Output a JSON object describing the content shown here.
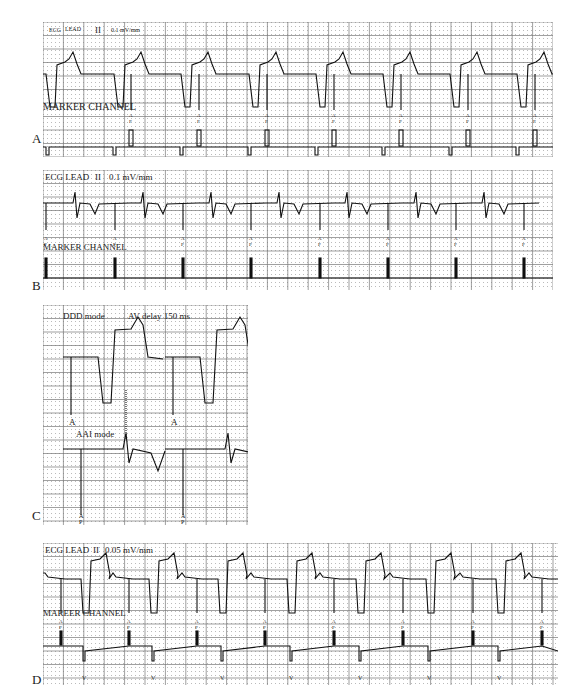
{
  "figure": {
    "panels": [
      {
        "id": "A",
        "letter": "A",
        "box": {
          "x": 43,
          "y": 22,
          "w": 510,
          "h": 135
        },
        "letter_pos": {
          "x": 32,
          "y": 143
        },
        "labels": {
          "lead": "ECG",
          "lead2": "LEAD",
          "lead_num": "II",
          "gain": "0.1 mV/mm",
          "marker": "MARKER CHANNEL"
        },
        "ecg_baseline": 60,
        "ecg_beats": [
          0,
          68,
          135,
          203,
          270,
          337,
          404,
          471
        ],
        "style": "paced_wide",
        "ap_markers": [
          88,
          156,
          224,
          291,
          358,
          425,
          492
        ],
        "vp_markers": [
          3,
          70,
          137,
          205,
          272,
          339,
          406,
          473
        ],
        "marker_glyph_ap": "A P",
        "marker_glyph_vp": "V"
      },
      {
        "id": "B",
        "letter": "B",
        "box": {
          "x": 43,
          "y": 170,
          "w": 510,
          "h": 120
        },
        "letter_pos": {
          "x": 32,
          "y": 290
        },
        "labels": {
          "lead": "ECG LEAD",
          "lead_num": "II",
          "gain": "0.1 mV/mm",
          "marker": "MARKER CHANNEL"
        },
        "style": "aai",
        "qrs_positions": [
          32,
          100,
          168,
          236,
          304,
          373,
          441
        ],
        "ap_markers": [
          3,
          72,
          140,
          208,
          277,
          345,
          413,
          481
        ],
        "marker_glyph_ap": "A P"
      },
      {
        "id": "C",
        "letter": "C",
        "box": {
          "x": 43,
          "y": 305,
          "w": 205,
          "h": 220
        },
        "letter_pos": {
          "x": 32,
          "y": 520
        },
        "labels": {
          "top_mode": "DDD mode",
          "av_delay": "AV delay 150 ms",
          "bottom_mode": "AAI mode",
          "marker_a": "A",
          "marker_ap": "A P"
        },
        "style": "ddd_vs_aai",
        "beats": [
          20,
          122
        ]
      },
      {
        "id": "D",
        "letter": "D",
        "box": {
          "x": 43,
          "y": 543,
          "w": 515,
          "h": 142
        },
        "letter_pos": {
          "x": 32,
          "y": 684
        },
        "labels": {
          "lead": "ECG LEAD",
          "lead_num": "II",
          "gain": "0.05 mV/mm",
          "marker": "MAREER CHANNEL"
        },
        "style": "paced_wide_d",
        "ecg_beats": [
          0,
          68,
          137,
          206,
          275,
          345,
          415,
          484
        ],
        "ap_markers": [
          18,
          86,
          154,
          222,
          291,
          360,
          430,
          499
        ],
        "vp_markers": [
          40,
          109,
          178,
          247,
          316,
          385,
          455
        ],
        "marker_glyph_ap": "A P",
        "marker_glyph_vp": "V"
      }
    ]
  }
}
